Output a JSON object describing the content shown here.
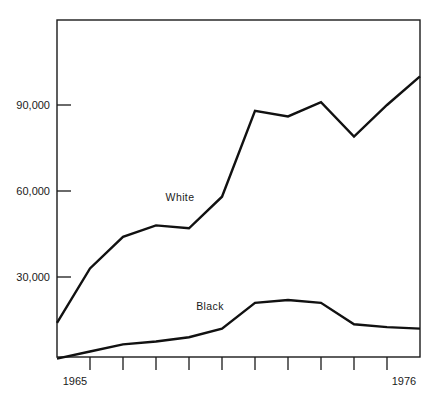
{
  "chart_data": {
    "type": "line",
    "title": "",
    "subtitle": "",
    "xlabel": "",
    "ylabel": "",
    "grid": false,
    "legend_position": "inline-annotations",
    "x": [
      1965,
      1966,
      1967,
      1968,
      1969,
      1970,
      1971,
      1972,
      1973,
      1974,
      1975,
      1976
    ],
    "x_tick_labels_shown": [
      "1965",
      "1976"
    ],
    "x_tick_count": 12,
    "xlim": [
      1965,
      1976
    ],
    "ylim": [
      0,
      120000
    ],
    "y_tick_labels": [
      "30,000",
      "60,000",
      "90,000"
    ],
    "y_ticks": [
      30000,
      60000,
      90000
    ],
    "series": [
      {
        "name": "White",
        "color": "#111111",
        "annotation": "White",
        "values": [
          14000,
          33000,
          44000,
          48000,
          47000,
          58000,
          88000,
          86000,
          91000,
          79000,
          90000,
          100000
        ]
      },
      {
        "name": "Black",
        "color": "#111111",
        "annotation": "Black",
        "values": [
          1500,
          4000,
          6500,
          7500,
          9000,
          12000,
          21000,
          22000,
          21000,
          13500,
          12500,
          12000
        ]
      }
    ]
  },
  "axes": {
    "y_labels": [
      "90,000",
      "60,000",
      "30,000"
    ],
    "x_label_left": "1965",
    "x_label_right": "1976"
  },
  "annotations": {
    "white": "White",
    "black": "Black"
  }
}
